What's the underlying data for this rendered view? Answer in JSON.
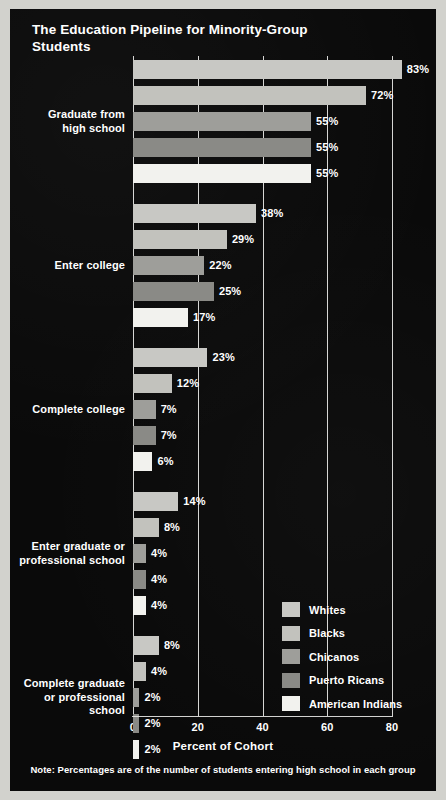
{
  "chart_data": {
    "type": "bar",
    "title": "The Education Pipeline for\nMinority-Group Students",
    "xlabel": "Percent of Cohort",
    "ylabel": "",
    "xlim": [
      0,
      80
    ],
    "xticks": [
      "0",
      "20",
      "40",
      "60",
      "80"
    ],
    "grid": true,
    "legend_position": "inside-bottom-right",
    "orientation": "horizontal",
    "note": "Note: Percentages are of the number of students entering high school in each group",
    "categories": [
      "Graduate from\nhigh school",
      "Enter college",
      "Complete college",
      "Enter graduate or\nprofessional school",
      "Complete graduate\nor professional\nschool"
    ],
    "series": [
      {
        "name": "Whites",
        "color": "#c8c8c4",
        "values": [
          83,
          38,
          23,
          14,
          8
        ]
      },
      {
        "name": "Blacks",
        "color": "#c2c2bd",
        "values": [
          72,
          29,
          12,
          8,
          4
        ]
      },
      {
        "name": "Chicanos",
        "color": "#9e9e9a",
        "values": [
          55,
          22,
          7,
          4,
          2
        ]
      },
      {
        "name": "Puerto Ricans",
        "color": "#8a8a86",
        "values": [
          55,
          25,
          7,
          4,
          2
        ]
      },
      {
        "name": "American Indians",
        "color": "#f2f2ee",
        "values": [
          55,
          17,
          6,
          4,
          2
        ]
      }
    ],
    "value_labels": [
      [
        "83%",
        "72%",
        "55%",
        "55%",
        "55%"
      ],
      [
        "38%",
        "29%",
        "22%",
        "25%",
        "17%"
      ],
      [
        "23%",
        "12%",
        "7%",
        "7%",
        "6%"
      ],
      [
        "14%",
        "8%",
        "4%",
        "4%",
        "4%"
      ],
      [
        "8%",
        "4%",
        "2%",
        "2%",
        "2%"
      ]
    ]
  },
  "legend": {
    "items": [
      {
        "label": "Whites",
        "color": "#c8c8c4"
      },
      {
        "label": "Blacks",
        "color": "#c2c2bd"
      },
      {
        "label": "Chicanos",
        "color": "#9e9e9a"
      },
      {
        "label": "Puerto Ricans",
        "color": "#8a8a86"
      },
      {
        "label": "American Indians",
        "color": "#f2f2ee"
      }
    ]
  }
}
